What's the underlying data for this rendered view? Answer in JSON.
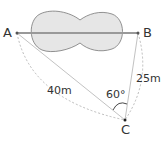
{
  "points": {
    "A": "A",
    "B": "B",
    "C": "C"
  },
  "lengths": {
    "AC": "40m",
    "BC": "25m"
  },
  "angle": {
    "C": "60°"
  },
  "colors": {
    "pond_fill": "#e6e6e6",
    "pond_stroke": "#777777",
    "line": "#999999",
    "dashed": "#aaaaaa"
  }
}
